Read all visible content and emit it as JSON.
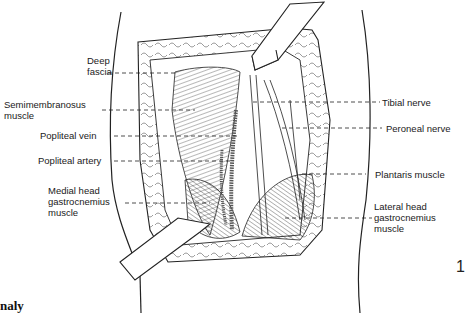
{
  "figure": {
    "number": "1",
    "caption_fragment": "naly",
    "labels_left": [
      {
        "id": "deep-fascia",
        "line1": "Deep",
        "line2": "fascia"
      },
      {
        "id": "semimembranosus",
        "line1": "Semimembranosus",
        "line2": "muscle"
      },
      {
        "id": "popliteal-vein",
        "line1": "Popliteal vein"
      },
      {
        "id": "popliteal-artery",
        "line1": "Popliteal artery"
      },
      {
        "id": "medial-head",
        "line1": "Medial head",
        "line2": "gastrocnemius",
        "line3": "muscle"
      }
    ],
    "labels_right": [
      {
        "id": "tibial-nerve",
        "line1": "Tibial nerve"
      },
      {
        "id": "peroneal-nerve",
        "line1": "Peroneal nerve"
      },
      {
        "id": "plantaris",
        "line1": "Plantaris muscle"
      },
      {
        "id": "lateral-head",
        "line1": "Lateral head",
        "line2": "gastrocnemius",
        "line3": "muscle"
      }
    ]
  }
}
